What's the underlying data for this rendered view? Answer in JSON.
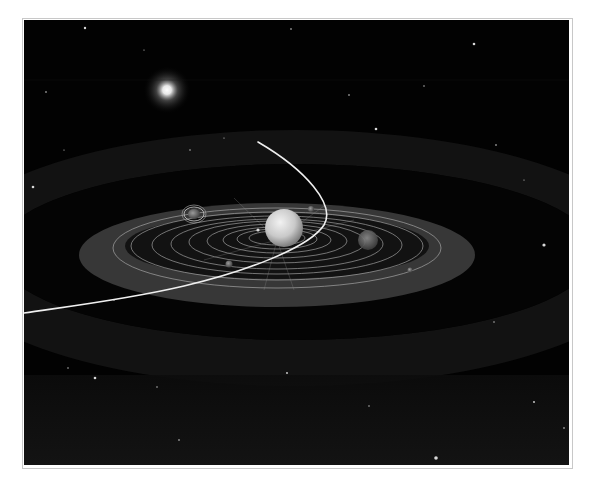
{
  "scene": {
    "description": "3D rendered illustration of a planetary system with a comet trajectory",
    "colors": {
      "space": "#020202",
      "frame_border": "#c8c8c8",
      "inner_disc": "#3a3a3a",
      "outer_band": "#151515",
      "orbit_lines": "#bdbdbd",
      "comet_path": "#f0f0f0",
      "central_body": "#d6d6d6"
    },
    "bright_star": {
      "x": 143,
      "y": 70,
      "radius": 22
    },
    "central_body": {
      "x": 260,
      "y": 208,
      "radius": 19
    },
    "ringed_planet": {
      "x": 170,
      "y": 194
    },
    "side_planet": {
      "x": 344,
      "y": 220
    },
    "orbits_count": 9
  }
}
